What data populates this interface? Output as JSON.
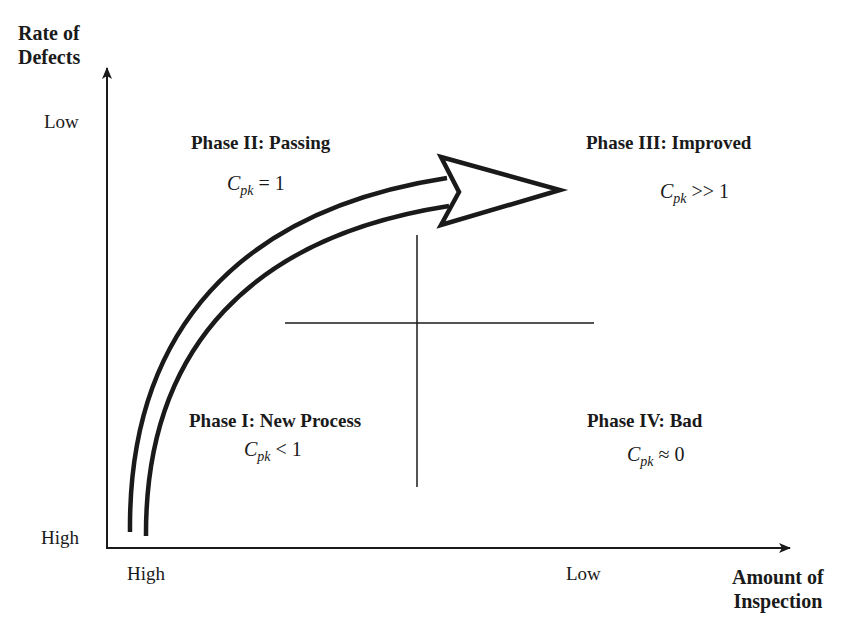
{
  "diagram": {
    "type": "quadrant",
    "y_axis": {
      "title_line1": "Rate of",
      "title_line2": "Defects",
      "tick_top": "Low",
      "tick_bottom": "High"
    },
    "x_axis": {
      "title_line1": "Amount of",
      "title_line2": "Inspection",
      "tick_left": "High",
      "tick_right": "Low"
    },
    "quadrants": [
      {
        "id": "phase-1",
        "title": "Phase I: New Process",
        "cpk_symbol": "C",
        "cpk_sub": "pk",
        "cpk_relation": "< 1",
        "position": "bottom-left"
      },
      {
        "id": "phase-2",
        "title": "Phase II: Passing",
        "cpk_symbol": "C",
        "cpk_sub": "pk",
        "cpk_relation": "= 1",
        "position": "top-left"
      },
      {
        "id": "phase-3",
        "title": "Phase III: Improved",
        "cpk_symbol": "C",
        "cpk_sub": "pk",
        "cpk_relation": ">> 1",
        "position": "top-right"
      },
      {
        "id": "phase-4",
        "title": "Phase IV: Bad",
        "cpk_symbol": "C",
        "cpk_sub": "pk",
        "cpk_relation": "≈ 0",
        "position": "bottom-right"
      }
    ],
    "progression_arrow": {
      "from": "Phase I: New Process",
      "via": "Phase II: Passing",
      "to": "Phase III: Improved"
    },
    "colors": {
      "ink": "#1a1a1a",
      "background": "#ffffff"
    }
  }
}
